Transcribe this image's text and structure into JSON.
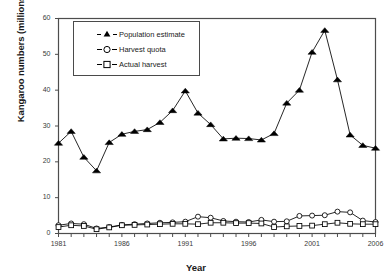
{
  "chart_data": {
    "type": "line",
    "title": "",
    "xlabel": "Year",
    "ylabel": "Kangaroo numbers  (millions)",
    "xlim": [
      1981,
      2006
    ],
    "ylim": [
      0,
      60
    ],
    "ytick_step": 10,
    "xtick_step": 1,
    "grid": false,
    "legend_position": "top-left-inside",
    "x": [
      1981,
      1982,
      1983,
      1984,
      1985,
      1986,
      1987,
      1988,
      1989,
      1990,
      1991,
      1992,
      1993,
      1994,
      1995,
      1996,
      1997,
      1998,
      1999,
      2000,
      2001,
      2002,
      2003,
      2004,
      2005,
      2006
    ],
    "xticklabels": [
      "1981",
      "1986",
      "1991",
      "1996",
      "2001",
      "2006"
    ],
    "xticklabel_values": [
      1981,
      1986,
      1991,
      1996,
      2001,
      2006
    ],
    "yticklabels": [
      "0",
      "10",
      "20",
      "30",
      "40",
      "50",
      "60"
    ],
    "yticklabel_values": [
      0,
      10,
      20,
      30,
      40,
      50,
      60
    ],
    "series": [
      {
        "name": "Population estimate",
        "marker": "filled-triangle",
        "color": "#000000",
        "values": [
          25.2,
          28.5,
          21.3,
          17.5,
          25.4,
          27.7,
          28.5,
          29.0,
          31.0,
          34.3,
          39.8,
          33.6,
          30.4,
          26.4,
          26.6,
          26.5,
          26.1,
          27.9,
          36.4,
          40.0,
          50.6,
          56.7,
          42.9,
          27.5,
          24.6,
          23.8
        ]
      },
      {
        "name": "Harvest quota",
        "marker": "open-circle",
        "color": "#000000",
        "values": [
          2.3,
          2.8,
          2.6,
          1.4,
          1.8,
          2.4,
          2.6,
          2.8,
          3.0,
          3.1,
          3.3,
          4.7,
          4.4,
          3.5,
          3.3,
          3.2,
          3.8,
          3.3,
          3.4,
          4.9,
          5.0,
          5.1,
          6.1,
          5.9,
          3.6,
          3.2
        ]
      },
      {
        "name": "Actual harvest",
        "marker": "open-square",
        "color": "#000000",
        "values": [
          1.8,
          2.3,
          2.1,
          1.2,
          1.7,
          2.3,
          2.4,
          2.5,
          2.6,
          2.7,
          2.7,
          2.6,
          3.0,
          3.0,
          2.9,
          2.9,
          2.8,
          1.8,
          2.0,
          2.1,
          2.2,
          2.6,
          3.0,
          2.7,
          2.6,
          2.6
        ]
      }
    ]
  },
  "legend": {
    "items": [
      {
        "label": "Population estimate",
        "marker": "filled-triangle"
      },
      {
        "label": "Harvest quota",
        "marker": "open-circle"
      },
      {
        "label": "Actual harvest",
        "marker": "open-square"
      }
    ]
  },
  "axes": {
    "x_title": "Year",
    "y_title": "Kangaroo numbers  (millions)"
  }
}
